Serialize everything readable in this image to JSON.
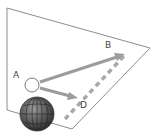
{
  "diagram": {
    "type": "vector-diagram",
    "labels": {
      "A": "A",
      "B": "B",
      "D": "D"
    },
    "elements": {
      "plane": {
        "shape": "quadrilateral",
        "stroke": "#888888"
      },
      "point_a": {
        "shape": "circle",
        "fill": "#ffffff",
        "stroke": "#777777"
      },
      "globe": {
        "shape": "sphere-with-grid",
        "fill": "#555555"
      },
      "arrow_ab": {
        "from": "A",
        "to": "B",
        "style": "solid",
        "color": "#9a9a9a"
      },
      "arrow_ad": {
        "from": "A",
        "to": "D",
        "style": "solid",
        "color": "#9a9a9a"
      },
      "line_db": {
        "from": "D",
        "to": "B",
        "style": "dashed",
        "color": "#a5a5a5"
      }
    }
  }
}
